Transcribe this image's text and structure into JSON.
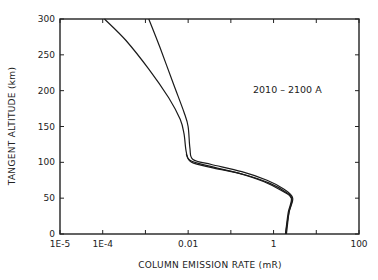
{
  "chart_data": {
    "type": "line",
    "title": "",
    "annotation": "2010 – 2100 A",
    "xlabel": "COLUMN EMISSION RATE (mR)",
    "ylabel": "TANGENT ALTITUDE (km)",
    "xscale": "log",
    "xlim": [
      1e-05,
      100
    ],
    "ylim": [
      0,
      300
    ],
    "grid": false,
    "legend": "none",
    "x_tick_labels": [
      "1E-5",
      "1E-4",
      "0.01",
      "1",
      "100"
    ],
    "x_tick_values": [
      1e-05,
      0.0001,
      0.01,
      1,
      100
    ],
    "y_tick_labels": [
      "0",
      "50",
      "100",
      "150",
      "200",
      "250",
      "300"
    ],
    "y_tick_values": [
      0,
      50,
      100,
      150,
      200,
      250,
      300
    ],
    "series": [
      {
        "name": "curve-1 (lower emission at high altitude)",
        "points": [
          {
            "x": 0.00011,
            "y": 300
          },
          {
            "x": 0.00035,
            "y": 270
          },
          {
            "x": 0.0012,
            "y": 230
          },
          {
            "x": 0.0035,
            "y": 190
          },
          {
            "x": 0.0065,
            "y": 160
          },
          {
            "x": 0.008,
            "y": 140
          },
          {
            "x": 0.009,
            "y": 115
          },
          {
            "x": 0.011,
            "y": 103
          },
          {
            "x": 0.03,
            "y": 95
          },
          {
            "x": 0.15,
            "y": 85
          },
          {
            "x": 0.6,
            "y": 73
          },
          {
            "x": 1.6,
            "y": 60
          },
          {
            "x": 2.6,
            "y": 50
          },
          {
            "x": 2.2,
            "y": 30
          },
          {
            "x": 1.9,
            "y": 0
          }
        ]
      },
      {
        "name": "curve-2 (higher emission at high altitude)",
        "points": [
          {
            "x": 0.0012,
            "y": 300
          },
          {
            "x": 0.0022,
            "y": 260
          },
          {
            "x": 0.0045,
            "y": 210
          },
          {
            "x": 0.008,
            "y": 170
          },
          {
            "x": 0.01,
            "y": 150
          },
          {
            "x": 0.011,
            "y": 120
          },
          {
            "x": 0.013,
            "y": 104
          },
          {
            "x": 0.035,
            "y": 97
          },
          {
            "x": 0.18,
            "y": 87
          },
          {
            "x": 0.7,
            "y": 75
          },
          {
            "x": 1.8,
            "y": 62
          },
          {
            "x": 2.8,
            "y": 50
          },
          {
            "x": 2.3,
            "y": 30
          },
          {
            "x": 1.9,
            "y": 0
          }
        ]
      },
      {
        "name": "curve-3 (near-coincident lower branch)",
        "points": [
          {
            "x": 0.009,
            "y": 112
          },
          {
            "x": 0.012,
            "y": 100
          },
          {
            "x": 0.04,
            "y": 92
          },
          {
            "x": 0.2,
            "y": 83
          },
          {
            "x": 0.8,
            "y": 71
          },
          {
            "x": 2.0,
            "y": 58
          },
          {
            "x": 2.7,
            "y": 49
          },
          {
            "x": 2.3,
            "y": 30
          },
          {
            "x": 2.0,
            "y": 0
          }
        ]
      }
    ],
    "colors": {
      "line": "#1a1a1a",
      "axis": "#222222",
      "background": "#ffffff"
    }
  }
}
